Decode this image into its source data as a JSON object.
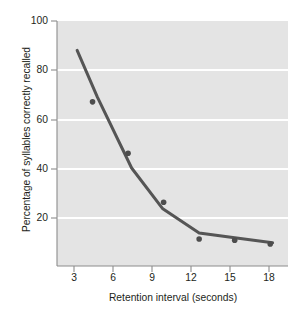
{
  "chart_data": {
    "type": "line",
    "title": "",
    "subtitle": "",
    "xlabel": "Retention interval (seconds)",
    "ylabel": "Percentage of syllables correctly recalled",
    "xlim": [
      0,
      19.5
    ],
    "ylim": [
      0,
      100
    ],
    "xticks": [
      3,
      6,
      9,
      12,
      15,
      18
    ],
    "xtick_labels": [
      "3",
      "6",
      "9",
      "12",
      "15",
      "18"
    ],
    "yticks": [
      20,
      40,
      60,
      80,
      100
    ],
    "ytick_labels": [
      "20",
      "40",
      "60",
      "80",
      "100"
    ],
    "grid": "horizontal-white-gridlines",
    "legend": "none",
    "plot_background": "#e4e4e4",
    "series": [
      {
        "name": "Percentage of syllables correctly recalled",
        "type": "scatter",
        "marker": "filled-circle",
        "color": "#4d4d4d",
        "x": [
          3,
          6,
          9,
          12,
          15,
          18
        ],
        "values": [
          67,
          46,
          26,
          11,
          10.5,
          9
        ]
      },
      {
        "name": "Fitted forgetting curve",
        "type": "line",
        "color": "#555555",
        "line_width": 3,
        "x": [
          1.7,
          3.4,
          6.3,
          8.9,
          12.0,
          15.0,
          18.2
        ],
        "values": [
          88,
          69,
          40,
          23.5,
          13.5,
          11.5,
          9.5
        ]
      }
    ]
  }
}
